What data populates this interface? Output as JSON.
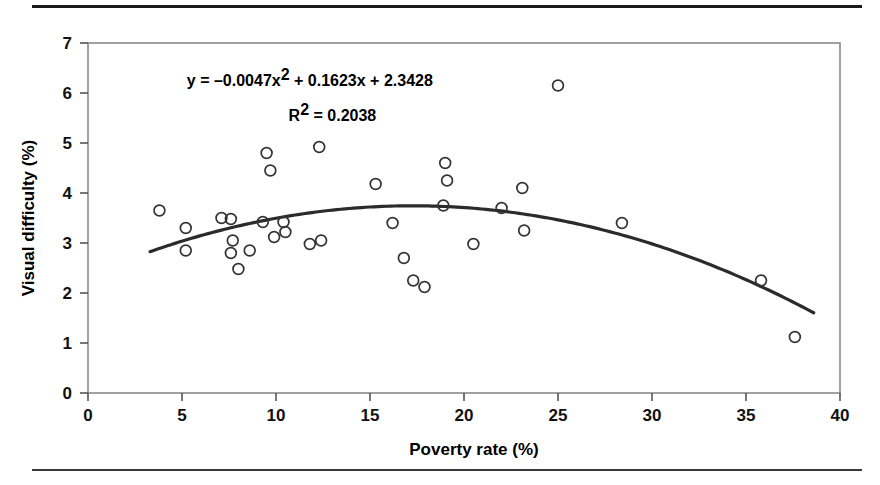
{
  "figure": {
    "has_top_rule": true,
    "has_bottom_rule": true,
    "background_color": "#ffffff",
    "marker_color": "#333333",
    "line_color": "#2b2b2b",
    "frame_color": "#8a8a8a"
  },
  "chart_data": {
    "type": "scatter",
    "title": "",
    "subtitle": "",
    "xlabel": "Poverty rate (%)",
    "ylabel": "Visual difficulty (%)",
    "xlim": [
      0,
      40
    ],
    "ylim": [
      0,
      7
    ],
    "xticks": [
      0,
      5,
      10,
      15,
      20,
      25,
      30,
      35,
      40
    ],
    "yticks": [
      0,
      1,
      2,
      3,
      4,
      5,
      6,
      7
    ],
    "xtick_labels": [
      "0",
      "5",
      "10",
      "15",
      "20",
      "25",
      "30",
      "35",
      "40"
    ],
    "ytick_labels": [
      "0",
      "1",
      "2",
      "3",
      "4",
      "5",
      "6",
      "7"
    ],
    "grid": false,
    "legend": false,
    "legend_position": "none",
    "marker": "open-circle",
    "annotations": [
      {
        "name": "regression-equation",
        "text_parts": [
          "y = –0.0047x",
          "2",
          " + 0.1623x + 2.3428"
        ],
        "text": "y = –0.0047x2 + 0.1623x + 2.3428",
        "x": 11.8,
        "y": 6.15
      },
      {
        "name": "r-squared",
        "text_parts": [
          "R",
          "2",
          " = 0.2038"
        ],
        "text": "R2 = 0.2038",
        "x": 13.0,
        "y": 5.45
      }
    ],
    "trendline": {
      "type": "quadratic",
      "equation": "y = -0.0047x^2 + 0.1623x + 2.3428",
      "a": -0.0047,
      "b": 0.1623,
      "c": 2.3428,
      "r_squared": 0.2038,
      "x_start": 3.3,
      "x_end": 38.6
    },
    "points": [
      {
        "x": 3.8,
        "y": 3.65
      },
      {
        "x": 5.2,
        "y": 3.3
      },
      {
        "x": 5.2,
        "y": 2.85
      },
      {
        "x": 7.1,
        "y": 3.5
      },
      {
        "x": 7.6,
        "y": 3.48
      },
      {
        "x": 7.7,
        "y": 3.05
      },
      {
        "x": 7.6,
        "y": 2.8
      },
      {
        "x": 8.0,
        "y": 2.48
      },
      {
        "x": 8.6,
        "y": 2.85
      },
      {
        "x": 9.3,
        "y": 3.42
      },
      {
        "x": 9.5,
        "y": 4.8
      },
      {
        "x": 9.7,
        "y": 4.45
      },
      {
        "x": 9.9,
        "y": 3.12
      },
      {
        "x": 10.4,
        "y": 3.42
      },
      {
        "x": 10.5,
        "y": 3.22
      },
      {
        "x": 11.8,
        "y": 2.98
      },
      {
        "x": 12.3,
        "y": 4.92
      },
      {
        "x": 12.4,
        "y": 3.05
      },
      {
        "x": 15.3,
        "y": 4.18
      },
      {
        "x": 16.2,
        "y": 3.4
      },
      {
        "x": 16.8,
        "y": 2.7
      },
      {
        "x": 17.3,
        "y": 2.25
      },
      {
        "x": 17.9,
        "y": 2.12
      },
      {
        "x": 18.9,
        "y": 3.75
      },
      {
        "x": 19.0,
        "y": 4.6
      },
      {
        "x": 19.1,
        "y": 4.25
      },
      {
        "x": 20.5,
        "y": 2.98
      },
      {
        "x": 22.0,
        "y": 3.7
      },
      {
        "x": 23.1,
        "y": 4.1
      },
      {
        "x": 23.2,
        "y": 3.25
      },
      {
        "x": 25.0,
        "y": 6.15
      },
      {
        "x": 28.4,
        "y": 3.4
      },
      {
        "x": 35.8,
        "y": 2.25
      },
      {
        "x": 37.6,
        "y": 1.12
      }
    ]
  }
}
